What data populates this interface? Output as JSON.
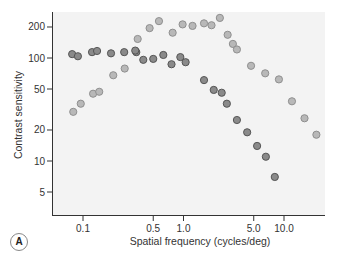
{
  "panel_label": "A",
  "chart_data": {
    "type": "scatter",
    "title": "",
    "xlabel": "Spatial frequency (cycles/deg)",
    "ylabel": "Contrast sensitivity",
    "xscale": "log",
    "yscale": "log",
    "xlim": [
      0.05,
      25
    ],
    "ylim": [
      3,
      330
    ],
    "xticks": [
      0.1,
      0.5,
      1.0,
      5.0,
      10.0
    ],
    "xtick_labels": [
      "0.1",
      "0.5",
      "1.0",
      "5.0",
      "10.0"
    ],
    "yticks": [
      5,
      10,
      20,
      50,
      100,
      200
    ],
    "ytick_labels": [
      "5",
      "10",
      "20",
      "50",
      "100",
      "200"
    ],
    "grid": false,
    "legend": null,
    "series": [
      {
        "name": "dark",
        "color": "#8a8a8a",
        "x": [
          0.078,
          0.089,
          0.123,
          0.138,
          0.19,
          0.257,
          0.339,
          0.331,
          0.398,
          0.5,
          0.63,
          0.76,
          0.93,
          1.05,
          1.6,
          2.0,
          2.4,
          2.7,
          3.4,
          4.3,
          5.4,
          6.6,
          8.1
        ],
        "y": [
          109,
          104,
          114,
          117,
          111,
          114,
          114,
          118,
          96,
          98,
          107,
          87,
          102,
          91,
          61,
          49,
          46,
          36,
          25,
          19,
          14,
          11,
          7
        ]
      },
      {
        "name": "light",
        "color": "#b8b8b8",
        "x": [
          0.08,
          0.095,
          0.126,
          0.145,
          0.2,
          0.26,
          0.35,
          0.46,
          0.57,
          0.78,
          0.98,
          1.23,
          1.6,
          1.9,
          2.3,
          2.75,
          3.1,
          3.4,
          4.7,
          6.5,
          8.9,
          12.0,
          16.0,
          21.0
        ],
        "y": [
          30,
          36,
          45,
          47,
          68,
          79,
          153,
          195,
          228,
          176,
          212,
          205,
          217,
          208,
          245,
          168,
          137,
          121,
          84,
          71,
          62,
          38,
          26,
          18
        ]
      }
    ]
  }
}
